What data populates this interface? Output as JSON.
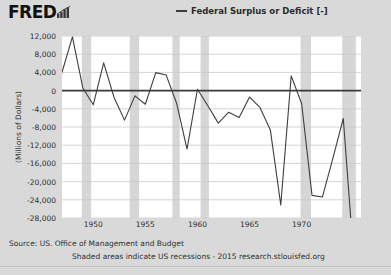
{
  "header": {
    "brand": "FRED",
    "brand_icon": "bar-chart-icon",
    "legend_label": "Federal Surplus or Deficit [-]",
    "legend_color": "#3b3b3b"
  },
  "footer": {
    "source": "Source: US. Office of Management and Budget",
    "note": "Shaded areas indicate US recessions - 2015 research.stlouisfed.org"
  },
  "colors": {
    "page_background": "#d9d9d9",
    "plot_background": "#ffffff",
    "gridline": "#c9c9c9",
    "zero_line": "#3b3b3b",
    "series_line": "#3f3f3f",
    "recession_band": "#d6d6d6"
  },
  "chart_data": {
    "type": "line",
    "title": "",
    "xlabel": "",
    "ylabel": "(Millions of Dollars)",
    "xlim": [
      1947,
      1975.7
    ],
    "ylim": [
      -28000,
      12000
    ],
    "grid": true,
    "legend_position": "top-center",
    "ytick_labels": [
      "12,000",
      "8,000",
      "4,000",
      "0",
      "-4,000",
      "-8,000",
      "-12,000",
      "-16,000",
      "-20,000",
      "-24,000",
      "-28,000"
    ],
    "ytick_values": [
      12000,
      8000,
      4000,
      0,
      -4000,
      -8000,
      -12000,
      -16000,
      -20000,
      -24000,
      -28000
    ],
    "xtick_labels": [
      "1950",
      "1955",
      "1960",
      "1965",
      "1970"
    ],
    "xtick_values": [
      1950,
      1955,
      1960,
      1965,
      1970
    ],
    "series": [
      {
        "name": "Federal Surplus or Deficit [-]",
        "color": "#3f3f3f",
        "x": [
          1947,
          1948,
          1949,
          1950,
          1951,
          1952,
          1953,
          1954,
          1955,
          1956,
          1957,
          1958,
          1959,
          1960,
          1961,
          1962,
          1963,
          1964,
          1965,
          1966,
          1967,
          1968,
          1969,
          1970,
          1971,
          1972,
          1973,
          1974,
          1975
        ],
        "values": [
          4018,
          11796,
          580,
          -3119,
          6102,
          -1519,
          -6493,
          -1154,
          -2993,
          3947,
          3412,
          -2769,
          -12849,
          301,
          -3335,
          -7146,
          -4756,
          -5915,
          -1411,
          -3698,
          -8643,
          -25161,
          3242,
          -2842,
          -23033,
          -23373,
          -14908,
          -6135,
          -53242
        ]
      }
    ],
    "annotations": [],
    "recessions": [
      {
        "start": 1945.0,
        "end": 1945.8
      },
      {
        "start": 1948.9,
        "end": 1949.8
      },
      {
        "start": 1953.5,
        "end": 1954.4
      },
      {
        "start": 1957.6,
        "end": 1958.3
      },
      {
        "start": 1960.3,
        "end": 1961.1
      },
      {
        "start": 1969.9,
        "end": 1970.9
      },
      {
        "start": 1973.9,
        "end": 1975.2
      }
    ]
  }
}
